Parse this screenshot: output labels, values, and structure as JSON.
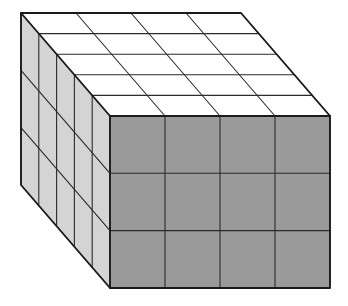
{
  "figure": {
    "name": "rectangular-prism-of-unit-cubes",
    "title": "Rectangular prism built from unit cubes",
    "projection": "oblique-isometric",
    "dimensions": {
      "width_cubes": 4,
      "height_cubes": 3,
      "depth_cubes": 5,
      "total_cubes": 60,
      "label_width": "4",
      "label_height": "3",
      "label_depth": "5"
    },
    "faces": {
      "top": {
        "name": "top-face",
        "color": "#ffffff",
        "columns": 4,
        "rows": 5,
        "cells": 20
      },
      "left": {
        "name": "left-face",
        "color": "#d4d4d4",
        "columns": 5,
        "rows": 3,
        "cells": 15
      },
      "front": {
        "name": "front-face",
        "color": "#9a9a9a",
        "columns": 4,
        "rows": 3,
        "cells": 12
      }
    },
    "colors": {
      "background": "#ffffff",
      "top_fill": "#ffffff",
      "left_fill": "#d4d4d4",
      "front_fill": "#9a9a9a",
      "grid_stroke": "#2b2b2b",
      "outline_stroke": "#1a1a1a"
    },
    "geometry": {
      "origin_back_top_left": [
        21,
        13
      ],
      "unit_width_vector": [
        55,
        0
      ],
      "unit_depth_vector": [
        17.8,
        20.6
      ],
      "unit_height_vector": [
        0,
        57.3
      ]
    }
  }
}
